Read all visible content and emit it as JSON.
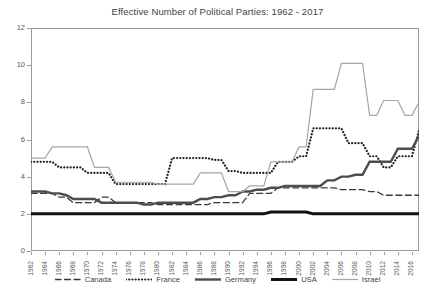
{
  "chart_data": {
    "type": "line",
    "title": "Effective Number of Political Parties: 1962 - 2017",
    "xlabel": "",
    "ylabel": "",
    "ylim": [
      0,
      12
    ],
    "yticks": [
      0,
      2,
      4,
      6,
      8,
      10,
      12
    ],
    "xlim": [
      1962,
      2017
    ],
    "grid": false,
    "legend_position": "bottom",
    "x": [
      1962,
      1963,
      1964,
      1965,
      1966,
      1967,
      1968,
      1969,
      1970,
      1971,
      1972,
      1973,
      1974,
      1975,
      1976,
      1977,
      1978,
      1979,
      1980,
      1981,
      1982,
      1983,
      1984,
      1985,
      1986,
      1987,
      1988,
      1989,
      1990,
      1991,
      1992,
      1993,
      1994,
      1995,
      1996,
      1997,
      1998,
      1999,
      2000,
      2001,
      2002,
      2003,
      2004,
      2005,
      2006,
      2007,
      2008,
      2009,
      2010,
      2011,
      2012,
      2013,
      2014,
      2015,
      2016,
      2017
    ],
    "xticks": [
      1962,
      1964,
      1966,
      1968,
      1970,
      1972,
      1974,
      1976,
      1978,
      1980,
      1982,
      1984,
      1986,
      1988,
      1990,
      1992,
      1994,
      1996,
      1998,
      2000,
      2002,
      2004,
      2006,
      2008,
      2010,
      2012,
      2014,
      2016
    ],
    "series": [
      {
        "name": "Canada",
        "style": "dashed",
        "color": "#3a3a3a",
        "width": 1.3,
        "values": [
          3.1,
          3.1,
          3.1,
          3.1,
          2.9,
          2.9,
          2.6,
          2.6,
          2.6,
          2.6,
          2.9,
          2.9,
          2.6,
          2.6,
          2.6,
          2.6,
          2.6,
          2.6,
          2.5,
          2.5,
          2.5,
          2.5,
          2.5,
          2.5,
          2.5,
          2.5,
          2.6,
          2.6,
          2.6,
          2.6,
          2.6,
          3.1,
          3.1,
          3.1,
          3.1,
          3.4,
          3.4,
          3.4,
          3.4,
          3.4,
          3.4,
          3.4,
          3.4,
          3.4,
          3.3,
          3.3,
          3.3,
          3.3,
          3.2,
          3.2,
          3.0,
          3.0,
          3.0,
          3.0,
          3.0,
          3.0
        ]
      },
      {
        "name": "France",
        "style": "dotted",
        "color": "#222222",
        "width": 2.2,
        "values": [
          4.8,
          4.8,
          4.8,
          4.8,
          4.5,
          4.5,
          4.5,
          4.5,
          4.2,
          4.2,
          4.2,
          4.2,
          3.6,
          3.6,
          3.6,
          3.6,
          3.6,
          3.6,
          3.6,
          3.6,
          5.0,
          5.0,
          5.0,
          5.0,
          5.0,
          5.0,
          4.9,
          4.9,
          4.3,
          4.3,
          4.2,
          4.2,
          4.2,
          4.2,
          4.2,
          4.8,
          4.8,
          4.8,
          5.1,
          5.1,
          6.6,
          6.6,
          6.6,
          6.6,
          6.6,
          5.8,
          5.8,
          5.8,
          5.1,
          5.1,
          4.5,
          4.5,
          5.1,
          5.1,
          5.1,
          6.5
        ]
      },
      {
        "name": "Germany",
        "style": "solid",
        "color": "#4d4d4d",
        "width": 2.4,
        "values": [
          3.2,
          3.2,
          3.2,
          3.1,
          3.1,
          3.0,
          2.8,
          2.8,
          2.8,
          2.8,
          2.6,
          2.6,
          2.6,
          2.6,
          2.6,
          2.6,
          2.5,
          2.5,
          2.6,
          2.6,
          2.6,
          2.6,
          2.6,
          2.6,
          2.8,
          2.8,
          2.9,
          2.9,
          3.0,
          3.0,
          3.2,
          3.2,
          3.3,
          3.3,
          3.4,
          3.4,
          3.5,
          3.5,
          3.5,
          3.5,
          3.5,
          3.5,
          3.8,
          3.8,
          4.0,
          4.0,
          4.1,
          4.1,
          4.8,
          4.8,
          4.8,
          4.8,
          5.5,
          5.5,
          5.5,
          6.2
        ]
      },
      {
        "name": "USA",
        "style": "solid",
        "color": "#111111",
        "width": 3.0,
        "values": [
          2.0,
          2.0,
          2.0,
          2.0,
          2.0,
          2.0,
          2.0,
          2.0,
          2.0,
          2.0,
          2.0,
          2.0,
          2.0,
          2.0,
          2.0,
          2.0,
          2.0,
          2.0,
          2.0,
          2.0,
          2.0,
          2.0,
          2.0,
          2.0,
          2.0,
          2.0,
          2.0,
          2.0,
          2.0,
          2.0,
          2.0,
          2.0,
          2.0,
          2.0,
          2.1,
          2.1,
          2.1,
          2.1,
          2.1,
          2.1,
          2.0,
          2.0,
          2.0,
          2.0,
          2.0,
          2.0,
          2.0,
          2.0,
          2.0,
          2.0,
          2.0,
          2.0,
          2.0,
          2.0,
          2.0,
          2.0
        ]
      },
      {
        "name": "Israel",
        "style": "solid",
        "color": "#a6a6a6",
        "width": 1.2,
        "values": [
          5.0,
          5.0,
          5.0,
          5.6,
          5.6,
          5.6,
          5.6,
          5.6,
          5.6,
          4.5,
          4.5,
          4.5,
          3.7,
          3.7,
          3.7,
          3.7,
          3.7,
          3.7,
          3.6,
          3.6,
          3.6,
          3.6,
          3.6,
          3.6,
          4.2,
          4.2,
          4.2,
          4.2,
          3.2,
          3.2,
          3.2,
          3.5,
          3.5,
          3.5,
          4.8,
          4.8,
          4.8,
          4.8,
          5.6,
          5.6,
          8.7,
          8.7,
          8.7,
          8.7,
          10.1,
          10.1,
          10.1,
          10.1,
          7.3,
          7.3,
          8.1,
          8.1,
          8.1,
          7.3,
          7.3,
          8.0
        ]
      }
    ]
  },
  "legend": {
    "items": [
      {
        "label": "Canada"
      },
      {
        "label": "France"
      },
      {
        "label": "Germany"
      },
      {
        "label": "USA"
      },
      {
        "label": "Israel"
      }
    ]
  }
}
